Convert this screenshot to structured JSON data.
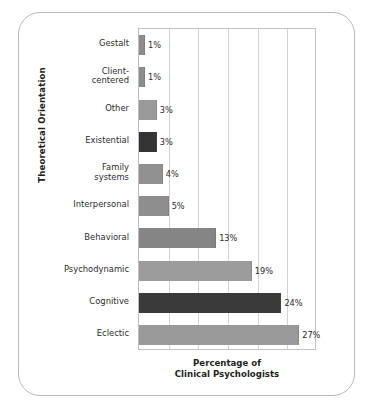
{
  "chart_data": {
    "type": "bar",
    "orientation": "horizontal",
    "title": "",
    "xlabel": "Percentage of Clinical Psychologists",
    "xlabel_lines": [
      "Percentage of",
      "Clinical Psychologists"
    ],
    "ylabel": "Theoretical Orientation",
    "xlim": [
      0,
      30
    ],
    "ylim": null,
    "grid": true,
    "gridline_values": [
      0,
      5,
      10,
      15,
      20,
      25,
      30
    ],
    "legend": null,
    "categories": [
      "Gestalt",
      "Client-centered",
      "Other",
      "Existential",
      "Family systems",
      "Interpersonal",
      "Behavioral",
      "Psychodynamic",
      "Cognitive",
      "Eclectic"
    ],
    "category_lines": [
      [
        "Gestalt"
      ],
      [
        "Client-",
        "centered"
      ],
      [
        "Other"
      ],
      [
        "Existential"
      ],
      [
        "Family",
        "systems"
      ],
      [
        "Interpersonal"
      ],
      [
        "Behavioral"
      ],
      [
        "Psychodynamic"
      ],
      [
        "Cognitive"
      ],
      [
        "Eclectic"
      ]
    ],
    "values": [
      1,
      1,
      3,
      3,
      4,
      5,
      13,
      19,
      24,
      27
    ],
    "data_labels": [
      "1%",
      "1%",
      "3%",
      "3%",
      "4%",
      "5%",
      "13%",
      "19%",
      "24%",
      "27%"
    ],
    "bar_colors": [
      "#8c8c8c",
      "#8c8c8c",
      "#9a9a9a",
      "#333333",
      "#919191",
      "#8e8e8e",
      "#858585",
      "#9c9c9c",
      "#3a3a3a",
      "#9a9a9a"
    ],
    "highlighted_categories": [
      "Existential",
      "Cognitive"
    ],
    "colors": {
      "bar_gray": "#9a9a9a",
      "bar_dark": "#363636",
      "grid": "#d3d3d7",
      "axis": "#c3c3c7",
      "frame": "#b9b9bd",
      "text": "#2b2b2b",
      "background": "#ffffff"
    }
  }
}
